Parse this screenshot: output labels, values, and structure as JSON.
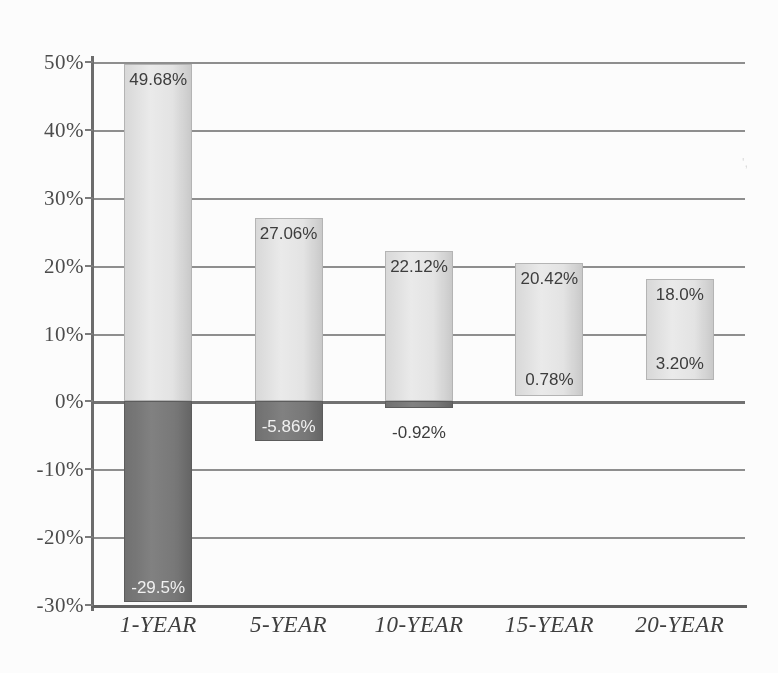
{
  "chart_data": {
    "type": "bar",
    "title": "",
    "subtitle": "",
    "xlabel": "",
    "ylabel": "",
    "categories": [
      "1-YEAR",
      "5-YEAR",
      "10-YEAR",
      "15-YEAR",
      "20-YEAR"
    ],
    "series": [
      {
        "name": "Best",
        "values": [
          49.68,
          27.06,
          22.12,
          20.42,
          18.0
        ],
        "labels": [
          "49.68%",
          "27.06%",
          "22.12%",
          "20.42%",
          "18.0%"
        ]
      },
      {
        "name": "Worst",
        "values": [
          -29.5,
          -5.86,
          -0.92,
          0.78,
          3.2
        ],
        "labels": [
          "-29.5%",
          "-5.86%",
          "-0.92%",
          "0.78%",
          "3.20%"
        ]
      }
    ],
    "ylim": [
      -30,
      50
    ],
    "ytick_values": [
      50,
      40,
      30,
      20,
      10,
      0,
      -10,
      -20,
      -30
    ],
    "ytick_labels": [
      "50%",
      "40%",
      "30%",
      "20%",
      "10%",
      "0%",
      "-10%",
      "-20%",
      "-30%"
    ],
    "grid": true,
    "legend": "none",
    "colors": {
      "positive_bar": "#e4e4e4",
      "negative_bar": "#777777",
      "gridline": "#8d8d8d",
      "axis": "#5f5f5f",
      "text": "#3a3a3a",
      "label_on_dark": "#f2f2f2",
      "background": "#fdfdfd"
    }
  },
  "artifact": {
    "mark": "',"
  }
}
